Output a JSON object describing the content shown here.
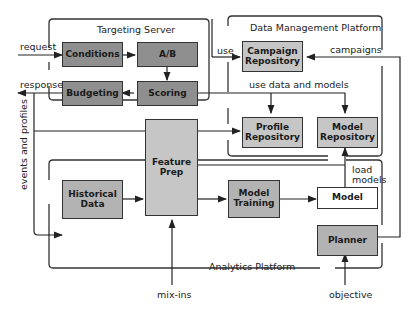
{
  "containers": {
    "targeting_server": "Targeting Server",
    "data_management_platform": "Data Management Platform",
    "analytics_platform": "Analytics Platform"
  },
  "boxes": {
    "conditions": "Conditions",
    "ab": "A/B",
    "budgeting": "Budgeting",
    "scoring": "Scoring",
    "campaign_repository": "Campaign Repository",
    "profile_repository": "Profile Repository",
    "model_repository": "Model Repository",
    "feature_prep": "Feature Prep",
    "historical_data": "Historical Data",
    "model_training": "Model Training",
    "model": "Model",
    "planner": "Planner"
  },
  "edge_labels": {
    "request": "request",
    "response": "response",
    "use": "use",
    "campaigns": "campaigns",
    "use_data_and_models": "use data and models",
    "events_and_profiles": "events and profiles",
    "load_models": "load models",
    "mix_ins": "mix-ins",
    "objective": "objective"
  },
  "colors": {
    "dark_box": "#8f8f8f",
    "light_box": "#c6c6c6",
    "line": "#333333"
  }
}
